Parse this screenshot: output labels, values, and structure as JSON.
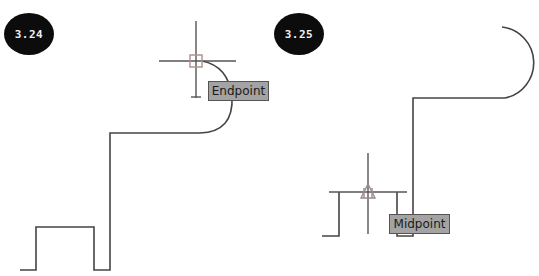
{
  "figures": [
    {
      "id": "left",
      "badge": "3.24",
      "snap_label": "Endpoint",
      "snap_marker": "square-endpoint-marker"
    },
    {
      "id": "right",
      "badge": "3.25",
      "snap_label": "Midpoint",
      "snap_marker": "triangle-midpoint-marker"
    }
  ],
  "colors": {
    "line": "#444444",
    "crosshair": "#555555",
    "marker": "#b08a8a",
    "label_bg": "#a3a3a3",
    "badge_bg": "#0c0c0c"
  }
}
